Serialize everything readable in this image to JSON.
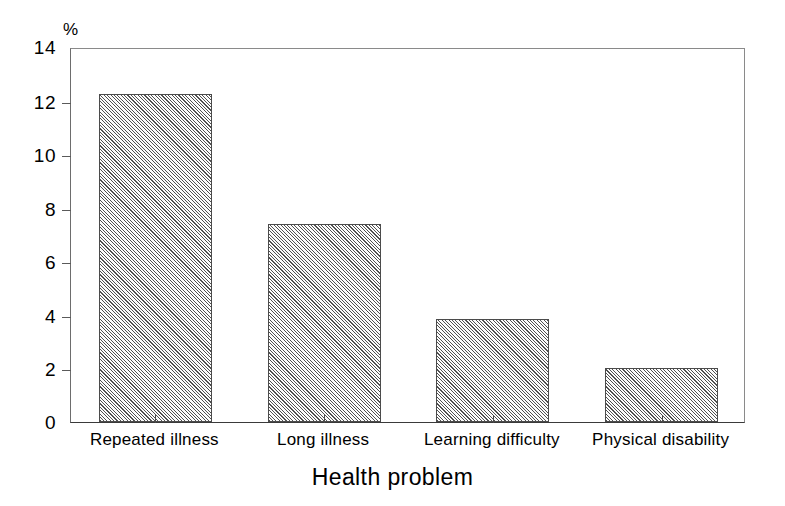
{
  "chart_data": {
    "type": "bar",
    "title": "",
    "subtitle": "",
    "xlabel": "Health problem",
    "ylabel": "%",
    "categories": [
      "Repeated illness",
      "Long illness",
      "Learning difficulty",
      "Physical disability"
    ],
    "values": [
      12.25,
      7.4,
      3.85,
      2.0
    ],
    "ylim": [
      0,
      14
    ],
    "yticks": [
      0,
      2,
      4,
      6,
      8,
      10,
      12,
      14
    ],
    "ytick_labels": [
      "0",
      "2",
      "4",
      "6",
      "8",
      "10",
      "12",
      "14"
    ],
    "grid": false,
    "legend": null,
    "series": [
      {
        "name": "Percentage",
        "values": [
          12.25,
          7.4,
          3.85,
          2.0
        ]
      }
    ],
    "bar_fill": "diagonal-hatch-gray",
    "colors": {
      "bar_fill": "#cfcfcf",
      "bar_edge": "#4b4b4b",
      "axis": "#3a3a3a",
      "text": "#000000",
      "background": "#ffffff"
    }
  },
  "axes": {
    "y_unit": "%",
    "x_title": "Health problem"
  }
}
